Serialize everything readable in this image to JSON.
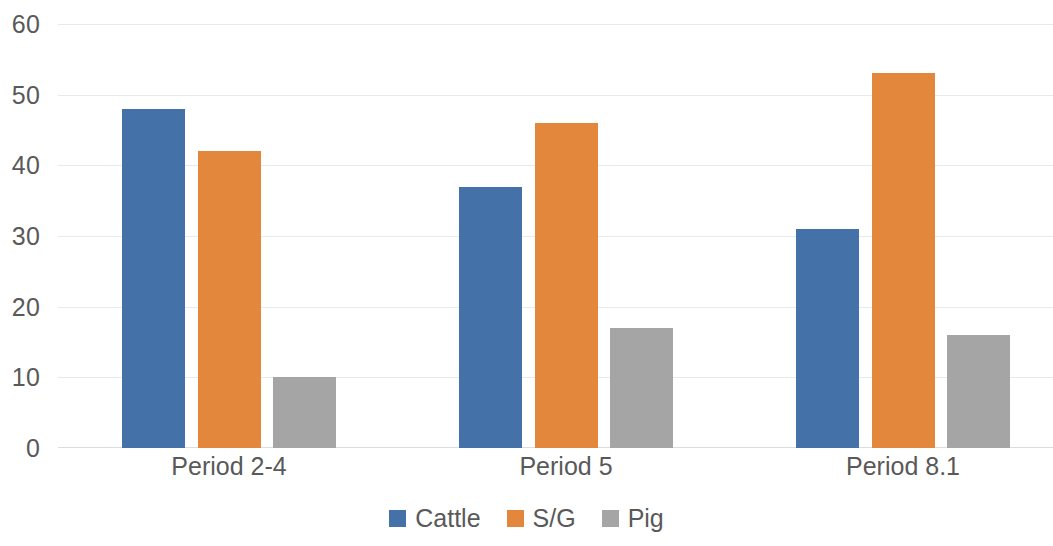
{
  "chart_data": {
    "type": "bar",
    "title": "",
    "subtitle": "",
    "xlabel": "",
    "ylabel": "",
    "categories": [
      "Period 2-4",
      "Period 5",
      "Period 8.1"
    ],
    "series": [
      {
        "name": "Cattle",
        "color": "#4472A8",
        "values": [
          48,
          37,
          31
        ]
      },
      {
        "name": "S/G",
        "color": "#E2873B",
        "values": [
          42,
          46,
          53
        ]
      },
      {
        "name": "Pig",
        "color": "#A5A5A5",
        "values": [
          10,
          17,
          16
        ]
      }
    ],
    "ylim": [
      0,
      60
    ],
    "yticks": [
      0,
      10,
      20,
      30,
      40,
      50,
      60
    ],
    "ytick_labels": [
      "0",
      "10",
      "20",
      "30",
      "40",
      "50",
      "60"
    ],
    "grid": true,
    "grid_axis": "y",
    "legend": true,
    "legend_position": "bottom",
    "axis_label_color": "#595959",
    "gridline_color": "#E4EAEF",
    "background": "#FFFFFF"
  },
  "axis": {
    "y_tick_0": "0",
    "y_tick_1": "10",
    "y_tick_2": "20",
    "y_tick_3": "30",
    "y_tick_4": "40",
    "y_tick_5": "50",
    "y_tick_6": "60"
  },
  "categories": {
    "cat_0": "Period 2-4",
    "cat_1": "Period 5",
    "cat_2": "Period 8.1"
  },
  "legend": {
    "item_0": "Cattle",
    "item_1": "S/G",
    "item_2": "Pig"
  }
}
